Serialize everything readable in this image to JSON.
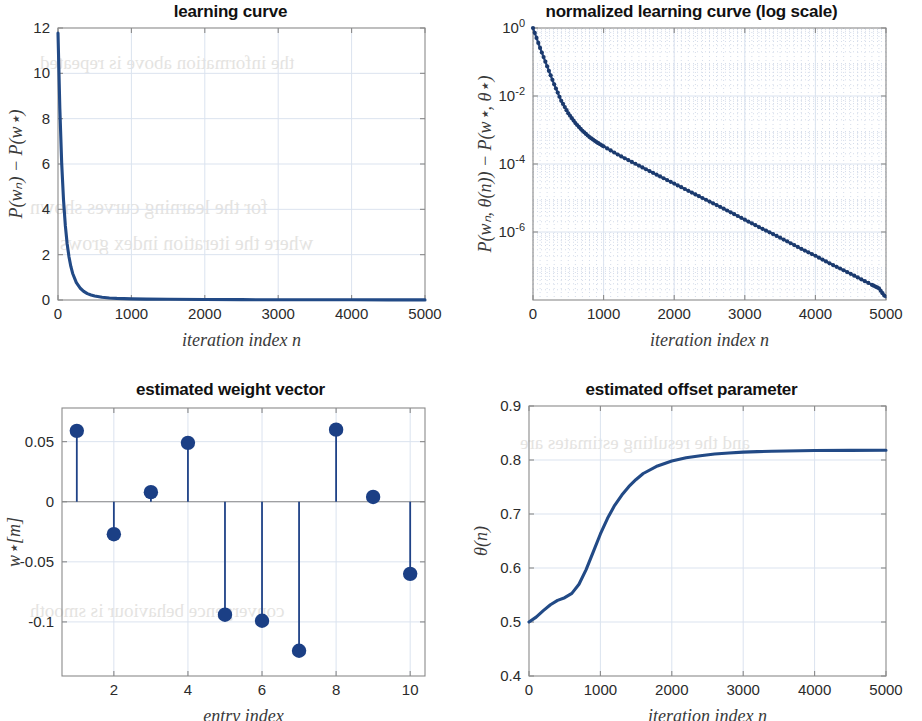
{
  "page": {
    "background": "#ffffff",
    "accent": "#224a86",
    "axis_color": "#8a8a8a",
    "grid_color": "#dbe3ef",
    "bleed_text": [
      "the information above is repeated",
      "for the learning curves shown",
      "where the iteration index grows",
      "and the resulting estimates are",
      "convergence behaviour is smooth"
    ]
  },
  "panels": [
    {
      "id": "learning-curve",
      "title": "learning curve",
      "xlabel": "iteration index n",
      "ylabel": "P(wₙ) − P(w⋆)"
    },
    {
      "id": "normalized-learning-curve",
      "title": "normalized learning curve (log scale)",
      "xlabel": "iteration index n",
      "ylabel": "P(wₙ, θ(n)) − P(w⋆, θ⋆)"
    },
    {
      "id": "estimated-weight-vector",
      "title": "estimated weight vector",
      "xlabel": "entry index",
      "ylabel": "w⋆[m]"
    },
    {
      "id": "estimated-offset-parameter",
      "title": "estimated offset parameter",
      "xlabel": "iteration index n",
      "ylabel": "θ(n)"
    }
  ],
  "chart_data": [
    {
      "type": "line",
      "id": "learning-curve",
      "title": "learning curve",
      "xlabel": "iteration index n",
      "ylabel": "P(w_n) - P(w*)",
      "xlim": [
        0,
        5000
      ],
      "ylim": [
        0,
        12
      ],
      "xticks": [
        0,
        1000,
        2000,
        3000,
        4000,
        5000
      ],
      "xtick_labels": [
        "0",
        "1000",
        "2000",
        "3000",
        "4000",
        "5000"
      ],
      "yticks": [
        0,
        2,
        4,
        6,
        8,
        10,
        12
      ],
      "ytick_labels": [
        "0",
        "2",
        "4",
        "6",
        "8",
        "10",
        "12"
      ],
      "grid": true,
      "legend": "none",
      "series": [
        {
          "name": "excess risk",
          "x": [
            0,
            25,
            50,
            75,
            100,
            125,
            150,
            175,
            200,
            250,
            300,
            350,
            400,
            450,
            500,
            600,
            700,
            800,
            1000,
            1200,
            1500,
            2000,
            2500,
            3000,
            3500,
            4000,
            4500,
            5000
          ],
          "y": [
            11.78,
            8.45,
            6.05,
            4.42,
            3.28,
            2.47,
            1.9,
            1.48,
            1.17,
            0.77,
            0.53,
            0.38,
            0.28,
            0.22,
            0.18,
            0.12,
            0.09,
            0.07,
            0.05,
            0.04,
            0.03,
            0.02,
            0.015,
            0.012,
            0.01,
            0.008,
            0.006,
            0.005
          ]
        }
      ]
    },
    {
      "type": "line",
      "id": "normalized-learning-curve",
      "title": "normalized learning curve (log scale)",
      "xlabel": "iteration index n",
      "ylabel": "P(w_n, theta(n)) - P(w*, theta*)",
      "yscale": "log",
      "xlim": [
        0,
        5000
      ],
      "ylim": [
        1e-08,
        1
      ],
      "xticks": [
        0,
        1000,
        2000,
        3000,
        4000,
        5000
      ],
      "xtick_labels": [
        "0",
        "1000",
        "2000",
        "3000",
        "4000",
        "5000"
      ],
      "yticks": [
        1,
        0.01,
        0.0001,
        1e-06
      ],
      "ytick_labels": [
        "10^0",
        "10^-2",
        "10^-4",
        "10^-6"
      ],
      "grid": true,
      "minor_grid": true,
      "markers": true,
      "legend": "none",
      "series": [
        {
          "name": "normalized excess risk",
          "x": [
            0,
            100,
            200,
            300,
            400,
            500,
            600,
            700,
            800,
            900,
            1000,
            1200,
            1400,
            1600,
            1800,
            2000,
            2200,
            2400,
            2600,
            2800,
            3000,
            3200,
            3400,
            3600,
            3800,
            4000,
            4200,
            4400,
            4600,
            4800,
            4900,
            5000
          ],
          "y": [
            1.0,
            0.26,
            0.075,
            0.022,
            0.0072,
            0.0031,
            0.0016,
            0.00095,
            0.00062,
            0.00044,
            0.00033,
            0.00019,
            0.000115,
            7e-05,
            4.3e-05,
            2.65e-05,
            1.63e-05,
            1e-05,
            6.2e-06,
            3.8e-06,
            2.3e-06,
            1.4e-06,
            8.7e-07,
            5.3e-07,
            3.2e-07,
            2e-07,
            1.2e-07,
            7.5e-08,
            4.6e-08,
            2.8e-08,
            2.2e-08,
            1.15e-08
          ]
        }
      ]
    },
    {
      "type": "bar",
      "subtype": "stem",
      "id": "estimated-weight-vector",
      "title": "estimated weight vector",
      "xlabel": "entry index",
      "ylabel": "w*[m]",
      "xlim": [
        0.6,
        10.4
      ],
      "ylim": [
        -0.145,
        0.078
      ],
      "xticks": [
        2,
        4,
        6,
        8,
        10
      ],
      "xtick_labels": [
        "2",
        "4",
        "6",
        "8",
        "10"
      ],
      "yticks": [
        0.05,
        0,
        -0.05,
        -0.1
      ],
      "ytick_labels": [
        "0.05",
        "0",
        "-0.05",
        "-0.1"
      ],
      "grid": true,
      "legend": "none",
      "categories": [
        1,
        2,
        3,
        4,
        5,
        6,
        7,
        8,
        9,
        10
      ],
      "values": [
        0.059,
        -0.027,
        0.008,
        0.049,
        -0.094,
        -0.099,
        -0.124,
        0.06,
        0.004,
        -0.06
      ]
    },
    {
      "type": "line",
      "id": "estimated-offset-parameter",
      "title": "estimated offset parameter",
      "xlabel": "iteration index n",
      "ylabel": "theta(n)",
      "xlim": [
        0,
        5000
      ],
      "ylim": [
        0.4,
        0.9
      ],
      "xticks": [
        0,
        1000,
        2000,
        3000,
        4000,
        5000
      ],
      "xtick_labels": [
        "0",
        "1000",
        "2000",
        "3000",
        "4000",
        "5000"
      ],
      "yticks": [
        0.4,
        0.5,
        0.6,
        0.7,
        0.8,
        0.9
      ],
      "ytick_labels": [
        "0.4",
        "0.5",
        "0.6",
        "0.7",
        "0.8",
        "0.9"
      ],
      "grid": true,
      "legend": "none",
      "series": [
        {
          "name": "offset estimate",
          "x": [
            0,
            100,
            200,
            300,
            400,
            500,
            600,
            700,
            800,
            900,
            1000,
            1100,
            1200,
            1300,
            1400,
            1500,
            1600,
            1800,
            2000,
            2200,
            2400,
            2600,
            2800,
            3000,
            3200,
            3400,
            3600,
            3800,
            4000,
            4500,
            5000
          ],
          "y": [
            0.5,
            0.509,
            0.521,
            0.532,
            0.54,
            0.545,
            0.553,
            0.57,
            0.597,
            0.63,
            0.663,
            0.692,
            0.716,
            0.735,
            0.751,
            0.764,
            0.775,
            0.789,
            0.798,
            0.804,
            0.808,
            0.811,
            0.813,
            0.8145,
            0.8155,
            0.8163,
            0.8168,
            0.8172,
            0.8175,
            0.8178,
            0.818
          ]
        }
      ]
    }
  ]
}
